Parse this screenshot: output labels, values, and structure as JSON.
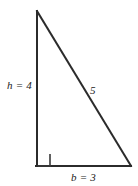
{
  "figure": {
    "name": "right-triangle-3-4-5",
    "background_color": "#ffffff",
    "stroke_color": "#2b2b2b",
    "labels": {
      "height": "h = 4",
      "hypotenuse": "5",
      "base": "b = 3"
    },
    "geometry": {
      "apex": [
        37,
        11
      ],
      "right_angle_vertex": [
        37,
        166
      ],
      "base_right_vertex": [
        131,
        166
      ],
      "right_angle_marker_size": 12
    },
    "icons": {
      "right_angle_marker": "right-angle-square-icon"
    }
  }
}
